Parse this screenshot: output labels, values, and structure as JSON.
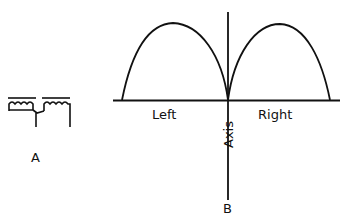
{
  "figure": {
    "panel_a": {
      "label": "A",
      "description": "two series coils with center tap"
    },
    "panel_b": {
      "label": "B",
      "axis_label": "Axis",
      "left_label": "Left",
      "right_label": "Right",
      "description": "figure-eight (bidirectional) polar pattern shown as two lobes either side of axis"
    },
    "colors": {
      "ink": "#111111",
      "background": "#ffffff"
    }
  }
}
